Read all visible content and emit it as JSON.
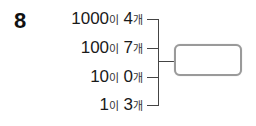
{
  "problem": {
    "number": "8",
    "rows": [
      {
        "place": "1000",
        "particle": "이",
        "count": "4",
        "unit": "개"
      },
      {
        "place": "100",
        "particle": "이",
        "count": "7",
        "unit": "개"
      },
      {
        "place": "10",
        "particle": "이",
        "count": "0",
        "unit": "개"
      },
      {
        "place": "1",
        "particle": "이",
        "count": "3",
        "unit": "개"
      }
    ],
    "answer": ""
  },
  "colors": {
    "text": "#1a1a1a",
    "bracket": "#444444",
    "box_border": "#9a9a9a"
  }
}
